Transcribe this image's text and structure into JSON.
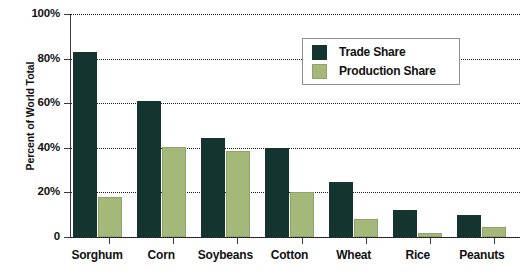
{
  "chart_data": {
    "type": "bar",
    "title": "",
    "xlabel": "",
    "ylabel": "Percent of World Total",
    "ylim": [
      0,
      100
    ],
    "ytick_labels": [
      "100%",
      "80%",
      "60%",
      "40%",
      "20%",
      "0"
    ],
    "ytick_values": [
      100,
      80,
      60,
      40,
      20,
      0
    ],
    "grid": "horizontal-dotted",
    "legend_position": "upper-right-inset",
    "categories": [
      "Sorghum",
      "Corn",
      "Soybeans",
      "Cotton",
      "Wheat",
      "Rice",
      "Peanuts"
    ],
    "series": [
      {
        "name": "Trade Share",
        "color": "#13342f",
        "values": [
          83,
          61,
          44.5,
          40,
          24.5,
          12,
          10
        ]
      },
      {
        "name": "Production Share",
        "color": "#a3b879",
        "values": [
          18,
          40.5,
          38.5,
          20,
          8,
          2,
          4.5
        ]
      }
    ]
  },
  "legend": {
    "items": [
      {
        "label": "Trade Share"
      },
      {
        "label": "Production Share"
      }
    ]
  }
}
